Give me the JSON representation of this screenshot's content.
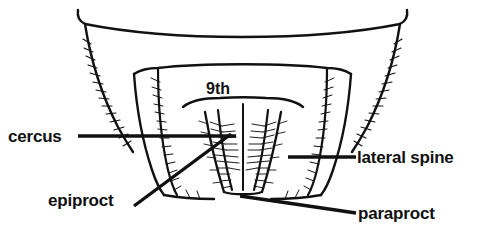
{
  "figure": {
    "kind": "scientific-line-drawing",
    "background_color": "#ffffff",
    "ink_color": "#111111",
    "caption": ""
  },
  "labels": {
    "cercus": "cercus",
    "lateral_spine": "lateral spine",
    "epiproct": "epiproct",
    "paraproct": "paraproct",
    "segment_ninth": "9th"
  },
  "leader_lines": [
    {
      "name": "cercus-leader",
      "from": [
        78,
        136
      ],
      "to": [
        236,
        136
      ],
      "orientation": "horizontal"
    },
    {
      "name": "lateral-spine-leader",
      "from": [
        288,
        157
      ],
      "to": [
        356,
        157
      ],
      "orientation": "horizontal"
    },
    {
      "name": "epiproct-leader",
      "from": [
        134,
        206
      ],
      "to": [
        231,
        134
      ],
      "orientation": "diagonal-up-right"
    },
    {
      "name": "paraproct-leader",
      "from": [
        240,
        196
      ],
      "to": [
        356,
        213
      ],
      "orientation": "diagonal-down-right"
    }
  ],
  "structures": [
    {
      "name": "abdominal-tergite-outline",
      "description": "broad shallow arc forming the upper body margin with hooked corners"
    },
    {
      "name": "left-lateral-lobe",
      "description": "tapering lobe on the left bearing a fringe of setae"
    },
    {
      "name": "right-lateral-lobe",
      "description": "tapering lobe on the right bearing a fringe of setae"
    },
    {
      "name": "epiproct-plate",
      "description": "median triangular plate between the paraprocts"
    },
    {
      "name": "paraproct-pair",
      "description": "paired narrow sclerites flanking the epiproct, densely setose"
    },
    {
      "name": "setal-fringe",
      "description": "rows of fine hair-like setae along lobe margins"
    }
  ]
}
